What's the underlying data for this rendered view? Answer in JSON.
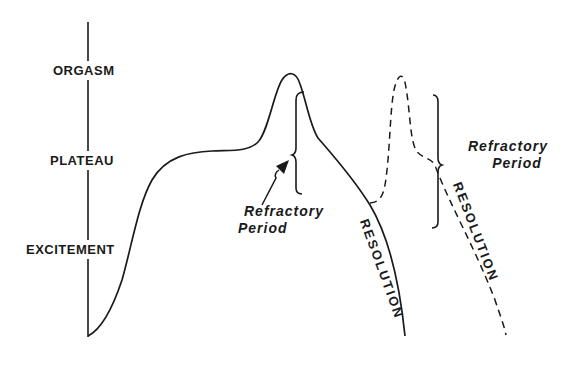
{
  "diagram": {
    "type": "sexual-response-cycle",
    "axis_labels": [
      "ORGASM",
      "PLATEAU",
      "EXCITEMENT"
    ],
    "annotations": {
      "refractory_1": {
        "line1": "Refractory",
        "line2": "Period"
      },
      "refractory_2": {
        "line1": "Refractory",
        "line2": "Period"
      },
      "resolution_1": "RESOLUTION",
      "resolution_2": "RESOLUTION"
    },
    "curves": [
      {
        "name": "primary-response",
        "style": "solid"
      },
      {
        "name": "second-response",
        "style": "dashed"
      }
    ],
    "colors": {
      "line": "#1a1a1a",
      "background": "#ffffff"
    }
  }
}
